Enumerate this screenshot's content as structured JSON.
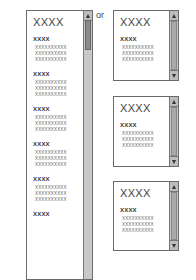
{
  "separator_label": "or",
  "tall_panel": {
    "title": "XXXX",
    "sections": [
      {
        "heading": "XXXX",
        "lines": [
          "XXXXXXXXXX",
          "XXXXXXXXXX",
          "XXXXXXXXXX"
        ]
      },
      {
        "heading": "XXXX",
        "lines": [
          "XXXXXXXXXX",
          "XXXXXXXXXX",
          "XXXXXXXXXX"
        ]
      },
      {
        "heading": "XXXX",
        "lines": [
          "XXXXXXXXXX",
          "XXXXXXXXXX",
          "XXXXXXXXXX"
        ]
      },
      {
        "heading": "XXXX",
        "lines": [
          "XXXXXXXXXX",
          "XXXXXXXXXX",
          "XXXXXXXXXX"
        ]
      },
      {
        "heading": "XXXX",
        "lines": [
          "XXXXXXXXXX",
          "XXXXXXXXXX",
          "XXXXXXXXXX"
        ]
      },
      {
        "heading": "XXXX",
        "lines": []
      }
    ],
    "scrollbar": {
      "up_icon": "arrow-up-icon"
    }
  },
  "small_panels": [
    {
      "title": "XXXX",
      "heading": "XXXX",
      "lines": [
        "XXXXXXXXXX",
        "XXXXXXXXXX",
        "XXXXXXXXXX"
      ]
    },
    {
      "title": "XXXX",
      "heading": "XXXX",
      "lines": [
        "XXXXXXXXXX",
        "XXXXXXXXXX",
        "XXXXXXXXXX"
      ]
    },
    {
      "title": "XXXX",
      "heading": "XXXX",
      "lines": [
        "XXXXXXXXXX",
        "XXXXXXXXXX",
        "XXXXXXXXXX"
      ]
    }
  ]
}
